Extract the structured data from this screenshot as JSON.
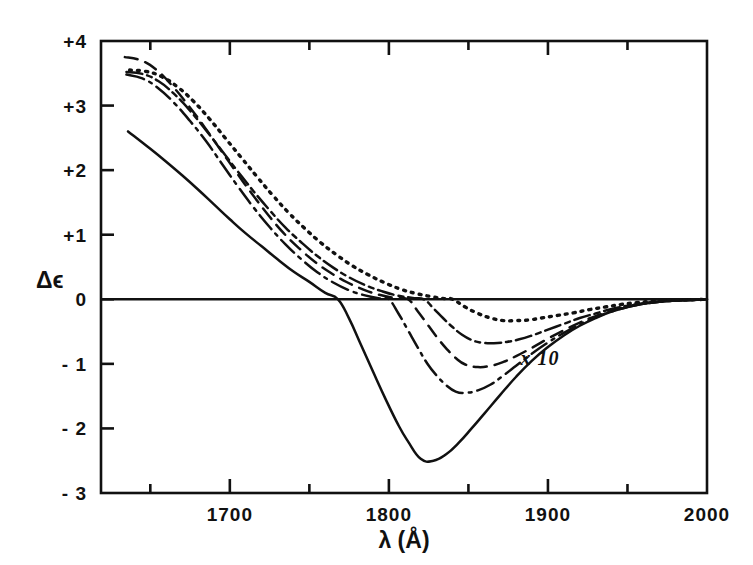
{
  "figure": {
    "title": "",
    "background_color": "#ffffff",
    "ink_color": "#111111"
  },
  "axes": {
    "x": {
      "label": "λ (Å)",
      "label_lambda": "λ",
      "label_unit": "(Å)",
      "min": 1619,
      "max": 2000,
      "major_ticks": [
        1700,
        1800,
        1900,
        2000
      ],
      "major_tick_labels": [
        "1700",
        "1800",
        "1900",
        "2000"
      ],
      "minor_ticks": [
        1650,
        1750,
        1850,
        1950
      ]
    },
    "y": {
      "label": "Δϵ",
      "label_delta": "Δ",
      "label_epsilon": "ϵ",
      "min": -3,
      "max": 4,
      "major_ticks": [
        4,
        3,
        2,
        1,
        0,
        -1,
        -2,
        -3
      ],
      "major_tick_labels": [
        "+4",
        "+3",
        "+2",
        "+1",
        "0",
        "- 1",
        "- 2",
        "- 3"
      ]
    },
    "grid": false,
    "zero_line": true
  },
  "annotations": [
    {
      "name": "scale-multiplier",
      "text": "x 10",
      "x": 1895,
      "y": -1.02
    }
  ],
  "chart_data": {
    "type": "line",
    "title": "",
    "xlabel": "λ (Å)",
    "ylabel": "Δϵ",
    "xlim": [
      1619,
      2000
    ],
    "ylim": [
      -3,
      4
    ],
    "grid": false,
    "legend": "none",
    "x_unit": "Angstrom",
    "series": [
      {
        "name": "curve-solid",
        "style": "solid",
        "dash": "none",
        "color": "#111111",
        "zero_crossing": 1768,
        "minimum": {
          "x": 1820,
          "y": -2.5
        },
        "start": {
          "x": 1636,
          "y": 2.6
        },
        "points": [
          [
            1636,
            2.6
          ],
          [
            1650,
            2.33
          ],
          [
            1660,
            2.13
          ],
          [
            1670,
            1.92
          ],
          [
            1680,
            1.7
          ],
          [
            1690,
            1.47
          ],
          [
            1700,
            1.24
          ],
          [
            1710,
            1.02
          ],
          [
            1720,
            0.82
          ],
          [
            1730,
            0.62
          ],
          [
            1740,
            0.43
          ],
          [
            1750,
            0.27
          ],
          [
            1760,
            0.1
          ],
          [
            1768,
            0.0
          ],
          [
            1775,
            -0.3
          ],
          [
            1782,
            -0.68
          ],
          [
            1790,
            -1.12
          ],
          [
            1798,
            -1.55
          ],
          [
            1806,
            -1.95
          ],
          [
            1812,
            -2.2
          ],
          [
            1820,
            -2.47
          ],
          [
            1828,
            -2.5
          ],
          [
            1836,
            -2.4
          ],
          [
            1844,
            -2.22
          ],
          [
            1852,
            -2.0
          ],
          [
            1860,
            -1.77
          ],
          [
            1870,
            -1.48
          ],
          [
            1880,
            -1.2
          ],
          [
            1890,
            -0.95
          ],
          [
            1900,
            -0.74
          ],
          [
            1910,
            -0.56
          ],
          [
            1920,
            -0.41
          ],
          [
            1930,
            -0.29
          ],
          [
            1940,
            -0.19
          ],
          [
            1950,
            -0.12
          ],
          [
            1960,
            -0.07
          ],
          [
            1970,
            -0.04
          ],
          [
            1980,
            -0.02
          ],
          [
            1990,
            -0.01
          ],
          [
            2000,
            0.0
          ]
        ]
      },
      {
        "name": "curve-dash-dot",
        "style": "dash-dot",
        "dash": "18,6,3,6",
        "color": "#111111",
        "zero_crossing": 1800,
        "minimum": {
          "x": 1845,
          "y": -1.45
        },
        "start": {
          "x": 1635,
          "y": 3.48
        },
        "points": [
          [
            1635,
            3.48
          ],
          [
            1645,
            3.42
          ],
          [
            1655,
            3.27
          ],
          [
            1665,
            3.04
          ],
          [
            1675,
            2.76
          ],
          [
            1685,
            2.45
          ],
          [
            1695,
            2.1
          ],
          [
            1705,
            1.75
          ],
          [
            1715,
            1.42
          ],
          [
            1725,
            1.12
          ],
          [
            1735,
            0.85
          ],
          [
            1745,
            0.62
          ],
          [
            1755,
            0.42
          ],
          [
            1765,
            0.26
          ],
          [
            1775,
            0.14
          ],
          [
            1785,
            0.06
          ],
          [
            1795,
            0.01
          ],
          [
            1800,
            0.0
          ],
          [
            1806,
            -0.22
          ],
          [
            1812,
            -0.48
          ],
          [
            1818,
            -0.74
          ],
          [
            1824,
            -0.99
          ],
          [
            1830,
            -1.18
          ],
          [
            1836,
            -1.33
          ],
          [
            1842,
            -1.43
          ],
          [
            1848,
            -1.45
          ],
          [
            1856,
            -1.41
          ],
          [
            1864,
            -1.32
          ],
          [
            1872,
            -1.18
          ],
          [
            1880,
            -1.03
          ],
          [
            1890,
            -0.84
          ],
          [
            1900,
            -0.67
          ],
          [
            1910,
            -0.52
          ],
          [
            1920,
            -0.39
          ],
          [
            1930,
            -0.28
          ],
          [
            1940,
            -0.19
          ],
          [
            1950,
            -0.12
          ],
          [
            1960,
            -0.07
          ],
          [
            1970,
            -0.04
          ],
          [
            1980,
            -0.02
          ],
          [
            1990,
            -0.01
          ],
          [
            2000,
            0.0
          ]
        ]
      },
      {
        "name": "curve-dashed",
        "style": "dashed",
        "dash": "13,8",
        "color": "#111111",
        "zero_crossing": 1812,
        "minimum": {
          "x": 1855,
          "y": -1.05
        },
        "start": {
          "x": 1634,
          "y": 3.75
        },
        "points": [
          [
            1634,
            3.75
          ],
          [
            1644,
            3.7
          ],
          [
            1654,
            3.55
          ],
          [
            1664,
            3.3
          ],
          [
            1674,
            3.0
          ],
          [
            1684,
            2.67
          ],
          [
            1694,
            2.32
          ],
          [
            1704,
            1.97
          ],
          [
            1714,
            1.63
          ],
          [
            1724,
            1.31
          ],
          [
            1734,
            1.02
          ],
          [
            1744,
            0.78
          ],
          [
            1754,
            0.57
          ],
          [
            1764,
            0.4
          ],
          [
            1774,
            0.26
          ],
          [
            1784,
            0.15
          ],
          [
            1794,
            0.07
          ],
          [
            1804,
            0.02
          ],
          [
            1812,
            0.0
          ],
          [
            1818,
            -0.18
          ],
          [
            1824,
            -0.38
          ],
          [
            1830,
            -0.58
          ],
          [
            1836,
            -0.76
          ],
          [
            1842,
            -0.91
          ],
          [
            1848,
            -1.01
          ],
          [
            1856,
            -1.05
          ],
          [
            1864,
            -1.03
          ],
          [
            1872,
            -0.97
          ],
          [
            1880,
            -0.88
          ],
          [
            1890,
            -0.75
          ],
          [
            1900,
            -0.61
          ],
          [
            1910,
            -0.48
          ],
          [
            1920,
            -0.36
          ],
          [
            1930,
            -0.26
          ],
          [
            1940,
            -0.18
          ],
          [
            1950,
            -0.11
          ],
          [
            1960,
            -0.07
          ],
          [
            1970,
            -0.04
          ],
          [
            1980,
            -0.02
          ],
          [
            1990,
            -0.01
          ],
          [
            2000,
            0.0
          ]
        ]
      },
      {
        "name": "curve-dash-dot-dot",
        "style": "dash-dot-dot",
        "dash": "16,5,5,5",
        "color": "#111111",
        "zero_crossing": 1822,
        "minimum": {
          "x": 1862,
          "y": -0.68
        },
        "start": {
          "x": 1635,
          "y": 3.52
        },
        "points": [
          [
            1635,
            3.52
          ],
          [
            1645,
            3.49
          ],
          [
            1655,
            3.38
          ],
          [
            1665,
            3.18
          ],
          [
            1675,
            2.92
          ],
          [
            1685,
            2.62
          ],
          [
            1695,
            2.3
          ],
          [
            1705,
            1.98
          ],
          [
            1715,
            1.67
          ],
          [
            1725,
            1.38
          ],
          [
            1735,
            1.11
          ],
          [
            1745,
            0.88
          ],
          [
            1755,
            0.67
          ],
          [
            1765,
            0.49
          ],
          [
            1775,
            0.34
          ],
          [
            1785,
            0.22
          ],
          [
            1795,
            0.13
          ],
          [
            1805,
            0.06
          ],
          [
            1815,
            0.02
          ],
          [
            1822,
            0.0
          ],
          [
            1828,
            -0.14
          ],
          [
            1834,
            -0.29
          ],
          [
            1840,
            -0.43
          ],
          [
            1846,
            -0.55
          ],
          [
            1852,
            -0.63
          ],
          [
            1858,
            -0.67
          ],
          [
            1866,
            -0.68
          ],
          [
            1874,
            -0.66
          ],
          [
            1882,
            -0.62
          ],
          [
            1890,
            -0.56
          ],
          [
            1900,
            -0.47
          ],
          [
            1910,
            -0.38
          ],
          [
            1920,
            -0.29
          ],
          [
            1930,
            -0.22
          ],
          [
            1940,
            -0.15
          ],
          [
            1950,
            -0.1
          ],
          [
            1960,
            -0.06
          ],
          [
            1970,
            -0.03
          ],
          [
            1980,
            -0.02
          ],
          [
            1990,
            -0.01
          ],
          [
            2000,
            0.0
          ]
        ]
      },
      {
        "name": "curve-dotted",
        "style": "dotted",
        "dash": "2,6",
        "color": "#111111",
        "zero_crossing": 1840,
        "minimum": {
          "x": 1875,
          "y": -0.33
        },
        "start": {
          "x": 1637,
          "y": 3.55
        },
        "points": [
          [
            1637,
            3.55
          ],
          [
            1647,
            3.53
          ],
          [
            1657,
            3.45
          ],
          [
            1667,
            3.29
          ],
          [
            1677,
            3.07
          ],
          [
            1687,
            2.8
          ],
          [
            1697,
            2.5
          ],
          [
            1707,
            2.2
          ],
          [
            1717,
            1.9
          ],
          [
            1727,
            1.61
          ],
          [
            1737,
            1.34
          ],
          [
            1747,
            1.1
          ],
          [
            1757,
            0.88
          ],
          [
            1767,
            0.69
          ],
          [
            1777,
            0.52
          ],
          [
            1787,
            0.38
          ],
          [
            1797,
            0.26
          ],
          [
            1807,
            0.16
          ],
          [
            1817,
            0.09
          ],
          [
            1827,
            0.04
          ],
          [
            1835,
            0.01
          ],
          [
            1840,
            0.0
          ],
          [
            1848,
            -0.12
          ],
          [
            1856,
            -0.22
          ],
          [
            1864,
            -0.29
          ],
          [
            1872,
            -0.33
          ],
          [
            1880,
            -0.33
          ],
          [
            1888,
            -0.32
          ],
          [
            1896,
            -0.29
          ],
          [
            1906,
            -0.25
          ],
          [
            1916,
            -0.21
          ],
          [
            1926,
            -0.16
          ],
          [
            1936,
            -0.12
          ],
          [
            1946,
            -0.08
          ],
          [
            1956,
            -0.05
          ],
          [
            1966,
            -0.03
          ],
          [
            1976,
            -0.02
          ],
          [
            1986,
            -0.01
          ],
          [
            2000,
            0.0
          ]
        ]
      }
    ]
  },
  "layout": {
    "plot_left_px": 101,
    "plot_right_px": 707,
    "plot_top_px": 41,
    "plot_bottom_px": 493
  }
}
